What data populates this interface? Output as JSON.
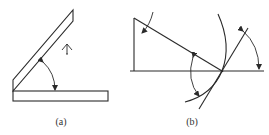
{
  "figure": {
    "panels": [
      {
        "id": "a",
        "label": "(a)",
        "description": "Two rectangular bars hinged at lower-left; slanted bar raised at an angle above horizontal base bar, with angle arc and upward rotation arrow symbol"
      },
      {
        "id": "b",
        "label": "(b)",
        "description": "Right triangle with hypotenuse meeting horizontal line at a point on a large circular arc; tangent line through the point with angle arcs"
      }
    ],
    "colors": {
      "line": "#2a2a2a",
      "background": "#ffffff",
      "text": "#333333"
    }
  }
}
